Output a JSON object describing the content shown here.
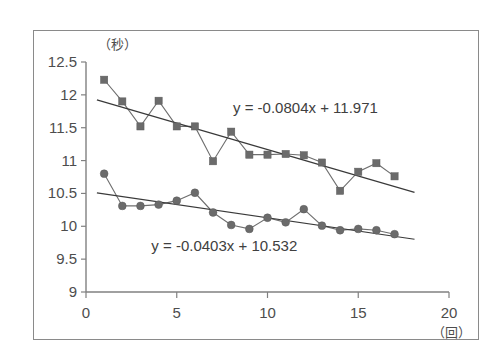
{
  "chart_data": {
    "type": "line",
    "title": "",
    "xlabel": "（回）",
    "ylabel": "（秒）",
    "xlim": [
      0,
      20
    ],
    "ylim": [
      9,
      12.5
    ],
    "xticks": [
      "0",
      "5",
      "10",
      "15",
      "20"
    ],
    "xtick_values": [
      0,
      5,
      10,
      15,
      20
    ],
    "yticks": [
      "12.5",
      "12",
      "11.5",
      "11",
      "10.5",
      "10",
      "9.5",
      "9"
    ],
    "ytick_values": [
      12.5,
      12,
      11.5,
      11,
      10.5,
      10,
      9.5,
      9
    ],
    "grid": false,
    "legend": "none",
    "x": [
      1,
      2,
      3,
      4,
      5,
      6,
      7,
      8,
      9,
      10,
      11,
      12,
      13,
      14,
      15,
      16,
      17
    ],
    "series": [
      {
        "name": "upper-series",
        "marker": "square",
        "color": "#6b6b6b",
        "values": [
          12.23,
          11.9,
          11.52,
          11.91,
          11.52,
          11.52,
          10.99,
          11.44,
          11.09,
          11.09,
          11.1,
          11.08,
          10.97,
          10.54,
          10.83,
          10.96,
          10.76
        ],
        "trendline": {
          "label": "y = -0.0804x + 11.971",
          "slope": -0.0804,
          "intercept": 11.971,
          "label_x": 8.1,
          "label_y": 11.72
        }
      },
      {
        "name": "lower-series",
        "marker": "circle",
        "color": "#6b6b6b",
        "values": [
          10.8,
          10.31,
          10.31,
          10.33,
          10.39,
          10.51,
          10.21,
          10.02,
          9.96,
          10.13,
          10.06,
          10.26,
          10.01,
          9.94,
          9.96,
          9.94,
          9.88
        ],
        "trendline": {
          "label": "y = -0.0403x + 10.532",
          "slope": -0.0403,
          "intercept": 10.532,
          "label_x": 3.6,
          "label_y": 9.62
        }
      }
    ]
  }
}
